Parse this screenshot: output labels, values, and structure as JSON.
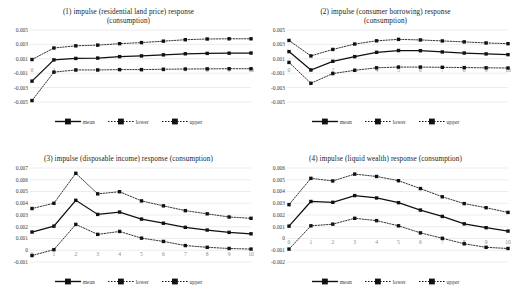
{
  "figure": {
    "background": "#ffffff",
    "line_color": "#111111",
    "grid_color": "#d9d9d9"
  },
  "legend": {
    "items": [
      {
        "label": "mean",
        "style": "solid",
        "marker": "square"
      },
      {
        "label": "lower",
        "style": "dotted",
        "marker": "square"
      },
      {
        "label": "upper",
        "style": "dotted",
        "marker": "square"
      }
    ]
  },
  "charts": [
    {
      "title_line1": "(1) impulse (residential land price)  response",
      "title_line2": "(consumption)",
      "chart_data": {
        "type": "line",
        "title": "(1) impulse (residential land price) response (consumption)",
        "xlabel": "",
        "ylabel": "",
        "x": [
          0,
          1,
          2,
          3,
          4,
          5,
          6,
          7,
          8,
          9,
          10
        ],
        "xticklabels": [
          "0",
          "1",
          "2",
          "3",
          "4",
          "5",
          "6",
          "7",
          "8",
          "9",
          "10"
        ],
        "yticks": [
          0.005,
          0.003,
          0.001,
          -0.001,
          -0.003,
          -0.005
        ],
        "ylim": [
          -0.005,
          0.005
        ],
        "grid": true,
        "legend_position": "bottom",
        "series": [
          {
            "name": "mean",
            "values": [
              -0.0021,
              0.00085,
              0.00105,
              0.0011,
              0.0013,
              0.0014,
              0.00155,
              0.0017,
              0.00175,
              0.00178,
              0.0018
            ]
          },
          {
            "name": "lower",
            "values": [
              -0.0048,
              -0.00085,
              -0.00055,
              -0.00055,
              -0.0005,
              -0.0005,
              -0.00045,
              -0.00042,
              -0.0004,
              -0.00038,
              -0.00038
            ]
          },
          {
            "name": "upper",
            "values": [
              0.0009,
              0.0025,
              0.0028,
              0.0029,
              0.0031,
              0.00325,
              0.00345,
              0.00365,
              0.00375,
              0.00378,
              0.00378
            ]
          }
        ]
      }
    },
    {
      "title_line1": "(2) impulse (consumer borrowing)  response",
      "title_line2": "(consumption)",
      "chart_data": {
        "type": "line",
        "title": "(2) impulse (consumer borrowing) response (consumption)",
        "xlabel": "",
        "ylabel": "",
        "x": [
          0,
          1,
          2,
          3,
          4,
          5,
          6,
          7,
          8,
          9,
          10
        ],
        "xticklabels": [
          "0",
          "1",
          "2",
          "3",
          "4",
          "5",
          "6",
          "7",
          "8",
          "9",
          "10"
        ],
        "yticks": [
          0.005,
          0.003,
          0.001,
          -0.001,
          -0.003,
          -0.005
        ],
        "ylim": [
          -0.005,
          0.005
        ],
        "grid": true,
        "legend_position": "bottom",
        "series": [
          {
            "name": "mean",
            "values": [
              0.002,
              -0.00055,
              0.00065,
              0.0013,
              0.0019,
              0.00215,
              0.00212,
              0.00195,
              0.0018,
              0.00168,
              0.00158
            ]
          },
          {
            "name": "lower",
            "values": [
              0.0005,
              -0.0024,
              -0.00105,
              -0.0006,
              -0.00025,
              -0.00015,
              -0.00015,
              -0.00018,
              -0.00022,
              -0.00025,
              -0.00028
            ]
          },
          {
            "name": "upper",
            "values": [
              0.00355,
              0.0014,
              0.0023,
              0.00305,
              0.0035,
              0.0037,
              0.00362,
              0.00348,
              0.00335,
              0.0032,
              0.0031
            ]
          }
        ]
      }
    },
    {
      "title_line1": "(3) impulse (disposable income)  response (consumption)",
      "title_line2": "",
      "chart_data": {
        "type": "line",
        "title": "(3) impulse (disposable income) response (consumption)",
        "xlabel": "",
        "ylabel": "",
        "x": [
          0,
          1,
          2,
          3,
          4,
          5,
          6,
          7,
          8,
          9,
          10
        ],
        "xticklabels": [
          "0",
          "1",
          "2",
          "3",
          "4",
          "5",
          "6",
          "7",
          "8",
          "9",
          "10"
        ],
        "yticks": [
          0.007,
          0.006,
          0.005,
          0.004,
          0.003,
          0.002,
          0.001,
          0,
          -0.001
        ],
        "ylim": [
          -0.001,
          0.007
        ],
        "grid": true,
        "legend_position": "bottom",
        "series": [
          {
            "name": "mean",
            "values": [
              0.00155,
              0.00205,
              0.00425,
              0.00305,
              0.00325,
              0.00265,
              0.0023,
              0.00195,
              0.00172,
              0.00152,
              0.0014
            ]
          },
          {
            "name": "lower",
            "values": [
              -0.00045,
              5e-05,
              0.0022,
              0.00135,
              0.0016,
              0.00103,
              0.00075,
              0.0004,
              0.00025,
              0.00015,
              0.0001
            ]
          },
          {
            "name": "upper",
            "values": [
              0.00355,
              0.004,
              0.00655,
              0.0048,
              0.00498,
              0.0042,
              0.00378,
              0.00337,
              0.0031,
              0.00283,
              0.00272
            ]
          }
        ]
      }
    },
    {
      "title_line1": "(4) impulse (liquid wealth)  response (consumption)",
      "title_line2": "",
      "chart_data": {
        "type": "line",
        "title": "(4) impulse (liquid wealth) response (consumption)",
        "xlabel": "",
        "ylabel": "",
        "x": [
          0,
          1,
          2,
          3,
          4,
          5,
          6,
          7,
          8,
          9,
          10
        ],
        "xticklabels": [
          "0",
          "1",
          "2",
          "3",
          "4",
          "5",
          "6",
          "7",
          "8",
          "9",
          "10"
        ],
        "yticks": [
          0.006,
          0.005,
          0.004,
          0.003,
          0.002,
          0.001,
          0,
          -0.001,
          -0.002
        ],
        "ylim": [
          -0.002,
          0.006
        ],
        "grid": true,
        "legend_position": "bottom",
        "series": [
          {
            "name": "mean",
            "values": [
              0.00105,
              0.00315,
              0.00308,
              0.00365,
              0.00345,
              0.00305,
              0.00242,
              0.00188,
              0.00125,
              0.00092,
              0.00063
            ]
          },
          {
            "name": "lower",
            "values": [
              -0.0009,
              0.00108,
              0.00122,
              0.00172,
              0.00152,
              0.00108,
              0.00048,
              2e-05,
              -0.00045,
              -0.00075,
              -0.00085
            ]
          },
          {
            "name": "upper",
            "values": [
              0.00288,
              0.00512,
              0.0049,
              0.00548,
              0.00528,
              0.00492,
              0.00425,
              0.00355,
              0.00297,
              0.00262,
              0.00222
            ]
          }
        ]
      }
    }
  ]
}
